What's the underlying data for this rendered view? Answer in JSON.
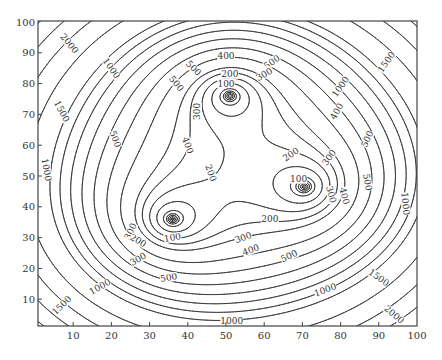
{
  "chart_data": {
    "type": "contour",
    "title": "",
    "xlabel": "",
    "ylabel": "",
    "xlim": [
      0,
      100
    ],
    "ylim": [
      0,
      100
    ],
    "x_ticks": [
      10,
      20,
      30,
      40,
      50,
      60,
      70,
      80,
      90,
      100
    ],
    "y_ticks": [
      10,
      20,
      30,
      40,
      50,
      60,
      70,
      80,
      90,
      100
    ],
    "grid": false,
    "legend": null,
    "minima": [
      {
        "x": 36,
        "y": 36
      },
      {
        "x": 51,
        "y": 76
      },
      {
        "x": 70.5,
        "y": 46.5
      }
    ],
    "field_scale": 0.4,
    "field_exponent": 0.6667,
    "levels": [
      15,
      30,
      45,
      60,
      75,
      100,
      150,
      200,
      250,
      300,
      400,
      500,
      600,
      700,
      800,
      900,
      1000,
      1250,
      1500,
      1750,
      2000,
      2250,
      2500
    ],
    "labeled_levels": [
      100,
      200,
      300,
      400,
      500,
      1000,
      1500,
      2000
    ],
    "contour_labels": [
      {
        "text": "2000",
        "x": 9,
        "y": 93,
        "rot": -50
      },
      {
        "text": "1500",
        "x": 7,
        "y": 71,
        "rot": -62
      },
      {
        "text": "1000",
        "x": 20,
        "y": 85,
        "rot": -55
      },
      {
        "text": "500",
        "x": 37,
        "y": 80,
        "rot": -50
      },
      {
        "text": "400",
        "x": 40,
        "y": 60,
        "rot": -70
      },
      {
        "text": "300",
        "x": 42.5,
        "y": 71,
        "rot": 90
      },
      {
        "text": "500",
        "x": 41.5,
        "y": 85,
        "rot": -45
      },
      {
        "text": "400",
        "x": 50,
        "y": 89,
        "rot": 0
      },
      {
        "text": "500",
        "x": 62,
        "y": 87,
        "rot": 35
      },
      {
        "text": "300",
        "x": 60,
        "y": 83,
        "rot": 30
      },
      {
        "text": "200",
        "x": 51,
        "y": 83,
        "rot": 0
      },
      {
        "text": "100",
        "x": 50,
        "y": 80,
        "rot": 0
      },
      {
        "text": "200",
        "x": 46,
        "y": 51,
        "rot": -70
      },
      {
        "text": "1000",
        "x": 80,
        "y": 79,
        "rot": 55
      },
      {
        "text": "1500",
        "x": 92,
        "y": 87,
        "rot": 55
      },
      {
        "text": "400",
        "x": 79,
        "y": 71,
        "rot": 60
      },
      {
        "text": "200",
        "x": 67,
        "y": 57,
        "rot": 35
      },
      {
        "text": "300",
        "x": 77,
        "y": 56,
        "rot": 55
      },
      {
        "text": "500",
        "x": 87,
        "y": 62,
        "rot": 65
      },
      {
        "text": "300",
        "x": 77.5,
        "y": 44,
        "rot": -75
      },
      {
        "text": "400",
        "x": 81,
        "y": 43.5,
        "rot": -75
      },
      {
        "text": "500",
        "x": 87,
        "y": 48,
        "rot": -80
      },
      {
        "text": "1000",
        "x": 97,
        "y": 41,
        "rot": -85
      },
      {
        "text": "100",
        "x": 69,
        "y": 49,
        "rot": 0
      },
      {
        "text": "200",
        "x": 61.5,
        "y": 36,
        "rot": 0
      },
      {
        "text": "300",
        "x": 54.5,
        "y": 30,
        "rot": 20
      },
      {
        "text": "400",
        "x": 56.5,
        "y": 26,
        "rot": 20
      },
      {
        "text": "500",
        "x": 66.5,
        "y": 24,
        "rot": 25
      },
      {
        "text": "1000",
        "x": 76,
        "y": 13,
        "rot": 20
      },
      {
        "text": "1500",
        "x": 90,
        "y": 17,
        "rot": -35
      },
      {
        "text": "2000",
        "x": 94,
        "y": 5,
        "rot": -40
      },
      {
        "text": "1000",
        "x": 51.5,
        "y": 3,
        "rot": 0
      },
      {
        "text": "1000",
        "x": 17,
        "y": 14,
        "rot": 30
      },
      {
        "text": "1500",
        "x": 7,
        "y": 8,
        "rot": 45
      },
      {
        "text": "1000",
        "x": 3,
        "y": 52,
        "rot": -80
      },
      {
        "text": "500",
        "x": 21,
        "y": 62,
        "rot": -70
      },
      {
        "text": "300",
        "x": 25,
        "y": 32,
        "rot": 65
      },
      {
        "text": "200",
        "x": 27,
        "y": 29,
        "rot": -30
      },
      {
        "text": "100",
        "x": 36,
        "y": 30,
        "rot": 10
      },
      {
        "text": "300",
        "x": 27,
        "y": 23,
        "rot": 30
      },
      {
        "text": "500",
        "x": 35,
        "y": 17,
        "rot": 10
      }
    ]
  },
  "layout": {
    "svg_width": 442,
    "svg_height": 360,
    "plot_left": 38,
    "plot_top": 21,
    "plot_right": 417,
    "plot_bottom": 326,
    "x_origin_px": 35,
    "x_px_per_unit": 3.82,
    "y_origin_px": 330,
    "y_px_per_unit": 3.08,
    "line_color": "#333333",
    "axis_color": "#444444"
  }
}
